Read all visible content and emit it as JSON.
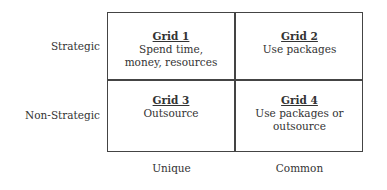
{
  "diagram": {
    "row_labels": [
      "Strategic",
      "Non-Strategic"
    ],
    "column_labels": [
      "Unique",
      "Common"
    ],
    "cells": [
      {
        "title": "Grid 1",
        "line1": "Spend time,",
        "line2": "money, resources"
      },
      {
        "title": "Grid 2",
        "line1": "Use packages",
        "line2": ""
      },
      {
        "title": "Grid 3",
        "line1": "Outsource",
        "line2": ""
      },
      {
        "title": "Grid 4",
        "line1": "Use packages or",
        "line2": "outsource"
      }
    ],
    "colors": {
      "border": "#444444",
      "text": "#333333",
      "background": "#ffffff"
    }
  }
}
